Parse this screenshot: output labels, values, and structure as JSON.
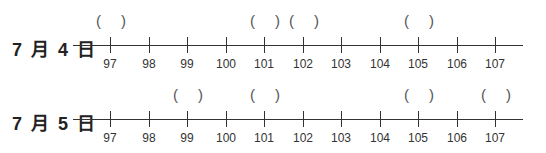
{
  "rows": [
    {
      "date_label": "7 月 4 日",
      "ticks": [
        "97",
        "98",
        "99",
        "100",
        "101",
        "102",
        "103",
        "104",
        "105",
        "106",
        "107"
      ],
      "bracket_positions": [
        97,
        101,
        102,
        105
      ]
    },
    {
      "date_label": "7 月 5 日",
      "ticks": [
        "97",
        "98",
        "99",
        "100",
        "101",
        "102",
        "103",
        "104",
        "105",
        "106",
        "107"
      ],
      "bracket_positions": [
        99,
        101,
        105,
        107
      ]
    }
  ],
  "bracket_open": "(",
  "bracket_close": ")"
}
